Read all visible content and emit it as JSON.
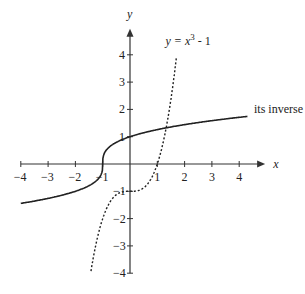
{
  "chart_data": {
    "type": "line",
    "title": "",
    "xlabel": "x",
    "ylabel": "y",
    "xlim": [
      -4,
      4
    ],
    "ylim": [
      -4,
      4
    ],
    "x_ticks": [
      "-4",
      "-3",
      "-2",
      "-1",
      "1",
      "2",
      "3",
      "4"
    ],
    "y_ticks": [
      "4",
      "3",
      "2",
      "1",
      "-1",
      "-2",
      "-3",
      "-4"
    ],
    "grid": false,
    "series": [
      {
        "name": "y = x^3 - 1",
        "style": "dashed",
        "function": "x^3 - 1",
        "x": [
          -1.4,
          -1,
          -0.5,
          0,
          0.5,
          1,
          1.3,
          1.7
        ],
        "y": [
          -3.74,
          -2,
          -1.125,
          -1,
          -0.875,
          0,
          1.197,
          3.91
        ]
      },
      {
        "name": "its inverse",
        "style": "solid",
        "function": "cbrt(x + 1)",
        "x": [
          -4,
          -3,
          -2,
          -1,
          0,
          1,
          2,
          4
        ],
        "y": [
          -1.44,
          -1.26,
          -1,
          0,
          1,
          1.26,
          1.44,
          1.71
        ]
      }
    ],
    "annotations": [
      "y = x³ - 1",
      "its inverse"
    ]
  },
  "labels": {
    "curve_label": "y = x",
    "curve_exp": "3",
    "curve_tail": "- 1",
    "inverse_label": "its inverse",
    "x_axis": "x",
    "y_axis": "y"
  }
}
